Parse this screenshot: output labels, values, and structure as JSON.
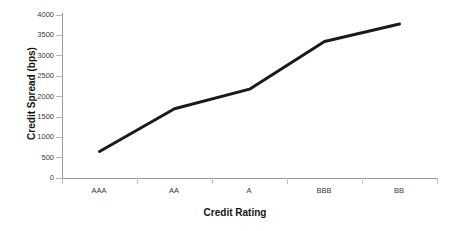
{
  "chart_data": {
    "type": "line",
    "title": "",
    "xlabel": "Credit Rating",
    "ylabel": "Credit Spread (bps)",
    "categories": [
      "AAA",
      "AA",
      "A",
      "BBB",
      "BB"
    ],
    "values": [
      650,
      1700,
      2180,
      3350,
      3780
    ],
    "series": [
      {
        "name": "Credit Spread",
        "values": [
          650,
          1700,
          2180,
          3350,
          3780
        ],
        "color": "#1a1a1a",
        "line_width": 3,
        "markers": false
      }
    ],
    "ylim": [
      0,
      4000
    ],
    "ytick_step": 500,
    "yticks": [
      0,
      500,
      1000,
      1500,
      2000,
      2500,
      3000,
      3500,
      4000
    ],
    "ytick_labels": [
      "0",
      "500",
      "1000",
      "1500",
      "2000",
      "2500",
      "3000",
      "3500",
      "4000"
    ],
    "grid": false,
    "legend": false,
    "legend_position": "none",
    "background_color": "#ffffff",
    "axis_color": "#9a9a9a",
    "text_color": "#3a3a3a"
  }
}
